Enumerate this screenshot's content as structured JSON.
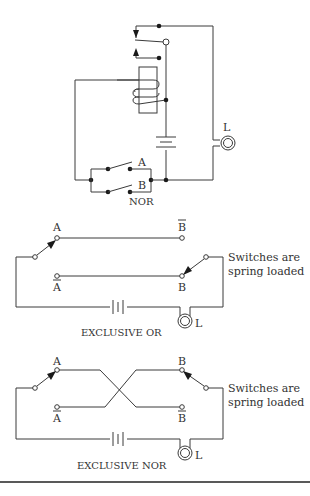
{
  "diagrams": [
    {
      "title": "NOR",
      "switch_labels": [
        "A",
        "B"
      ],
      "lamp_label": "L",
      "components": [
        "relay-coil",
        "relay-contact",
        "battery",
        "lamp",
        "switch-A",
        "switch-B"
      ]
    },
    {
      "title": "EXCLUSIVE OR",
      "switch_labels": [
        "A",
        "B"
      ],
      "terminal_labels": [
        "A",
        "Ā",
        "B",
        "B̄"
      ],
      "terminal_top_left": "A",
      "terminal_bottom_left": "A",
      "terminal_top_right": "B",
      "terminal_bottom_right": "B",
      "note_line1": "Switches are",
      "note_line2": "spring loaded",
      "lamp_label": "L"
    },
    {
      "title": "EXCLUSIVE NOR",
      "terminal_top_left": "A",
      "terminal_bottom_left": "A",
      "terminal_top_right": "B",
      "terminal_bottom_right": "B",
      "note_line1": "Switches are",
      "note_line2": "spring loaded",
      "lamp_label": "L"
    }
  ]
}
